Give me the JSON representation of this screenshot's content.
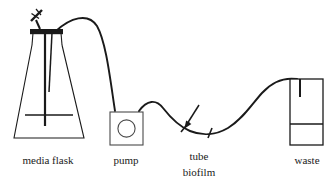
{
  "figure": {
    "type": "apparatus-schematic",
    "canvas": {
      "width": 333,
      "height": 187
    },
    "background_color": "#ffffff",
    "line_color": "#1a1a1a",
    "text_color": "#1a1a1a"
  },
  "labels": {
    "media_flask": "media flask",
    "pump": "pump",
    "tube": "tube",
    "biofilm": "biofilm",
    "waste": "waste"
  },
  "components": [
    {
      "id": "media-flask",
      "name": "media flask",
      "shape": "erlenmeyer-flask",
      "label": "media flask",
      "label_position": {
        "x": 48,
        "y": 164
      },
      "details": {
        "neck": "vertical twin-wall neck with rubber stopper",
        "stopper": "thick horizontal bar across neck top",
        "vent_clamp": "small diagonal clamp / syringe filter at top left of stopper",
        "dip_tube": "vertical tube descending into liquid",
        "liquid_level": "horizontal line inside flask body"
      }
    },
    {
      "id": "pump",
      "name": "pump",
      "shape": "square-box-with-circle",
      "label": "pump",
      "label_position": {
        "x": 126,
        "y": 164
      },
      "box": {
        "x": 110,
        "y": 112,
        "width": 33,
        "height": 33
      },
      "rotor_circle": {
        "cx": 126.5,
        "cy": 128.5,
        "r": 8.5
      }
    },
    {
      "id": "tube-biofilm",
      "name": "tube biofilm",
      "shape": "tube-segment-between-tick-marks",
      "label_lines": [
        "tube",
        "biofilm"
      ],
      "label_position": {
        "x": 199,
        "y": 160
      },
      "annotation_arrow": {
        "from": {
          "x": 199,
          "y": 107
        },
        "to": {
          "x": 185,
          "y": 126
        },
        "points_to": "tube segment"
      },
      "tick_marks": [
        {
          "x": 185,
          "y": 128
        },
        {
          "x": 210,
          "y": 133
        }
      ]
    },
    {
      "id": "waste",
      "name": "waste",
      "shape": "rectangular-carboy",
      "label": "waste",
      "label_position": {
        "x": 307,
        "y": 164
      },
      "box": {
        "x": 290,
        "y": 79,
        "width": 33,
        "height": 66
      },
      "liquid_level_y": 124,
      "inlet_tube_depth": 18
    }
  ],
  "tubing": {
    "description": "continuous flexible tube from flask stopper, arching over to pump, S-curving through the biofilm test section, rising and descending into the waste carboy",
    "segments": [
      {
        "from": "media flask stopper",
        "to": "pump inlet"
      },
      {
        "from": "pump outlet",
        "to": "tube biofilm section"
      },
      {
        "from": "tube biofilm section",
        "to": "waste inlet"
      }
    ]
  }
}
